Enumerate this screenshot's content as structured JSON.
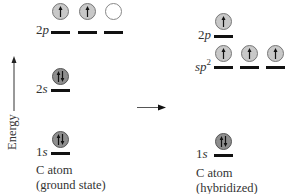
{
  "axis": {
    "label": "Energy",
    "direction": "up"
  },
  "transition_arrow": {
    "direction": "right"
  },
  "ground_state": {
    "caption_line1": "C atom",
    "caption_line2": "(ground state)",
    "levels": [
      {
        "label_num": "2",
        "label_sym": "p",
        "orbitals": [
          "half-up",
          "half-up",
          "empty"
        ]
      },
      {
        "label_num": "2",
        "label_sym": "s",
        "orbitals": [
          "full"
        ]
      },
      {
        "label_num": "1",
        "label_sym": "s",
        "orbitals": [
          "full"
        ]
      }
    ]
  },
  "hybridized": {
    "caption_line1": "C atom",
    "caption_line2": "(hybridized)",
    "levels": [
      {
        "label_num": "2",
        "label_sym": "p",
        "orbitals": [
          "half-up"
        ]
      },
      {
        "label_sym": "sp",
        "label_sup": "2",
        "orbitals": [
          "half-up",
          "half-up",
          "half-up"
        ]
      },
      {
        "label_num": "1",
        "label_sym": "s",
        "orbitals": [
          "full"
        ]
      }
    ]
  },
  "colors": {
    "half_filled": "#c8c8c8",
    "full": "#8e8e8e",
    "empty": "#ffffff",
    "line": "#111111"
  }
}
